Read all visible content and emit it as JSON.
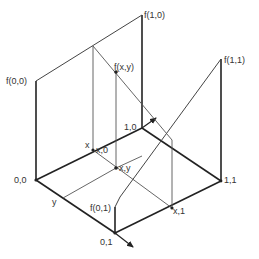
{
  "diagram": {
    "title": "",
    "labels": {
      "f00": "f(0,0)",
      "f10": "f(1,0)",
      "f11": "f(1,1)",
      "f01": "f(0,1)",
      "fxy": "f(x,y)",
      "p10": "1,0",
      "p00": "0,0",
      "p01": "0,1",
      "p11": "1,1",
      "px0": "x,0",
      "pxy": "x,y",
      "px1": "x,1",
      "x": "x",
      "y": "y"
    },
    "colors": {
      "line": "#222222",
      "thin": "#555555",
      "background": "#ffffff"
    }
  }
}
